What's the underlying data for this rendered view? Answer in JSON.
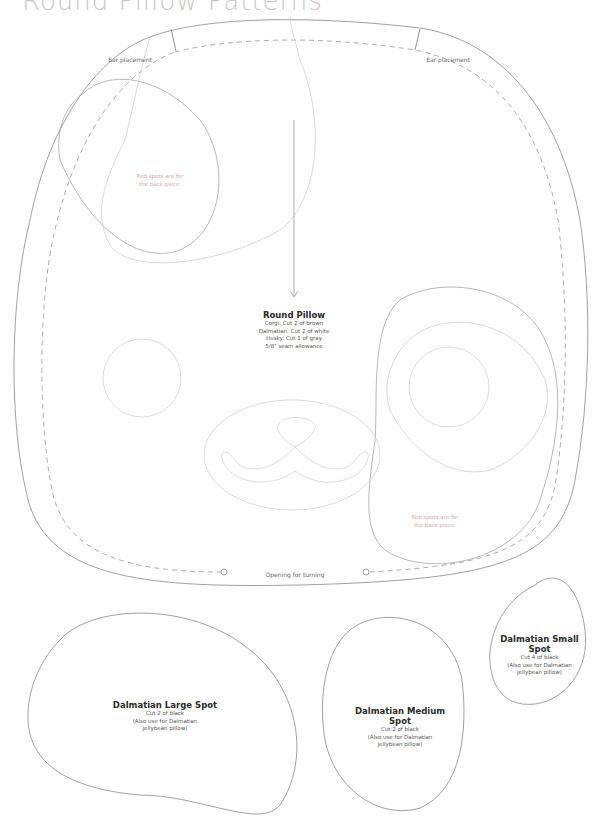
{
  "page": {
    "title": "Round Pillow Patterns"
  },
  "main_piece": {
    "name": "Round Pillow",
    "lines": [
      "Corgi: Cut 2 of brown",
      "Dalmatian: Cut 2 of white",
      "Husky: Cut 1 of gray",
      "5/8\" seam allowance"
    ],
    "ear_left": "Ear placement",
    "ear_right": "Ear placement",
    "opening": "Opening for turning",
    "spot_note_left": [
      "Red spots are for",
      "the back piece."
    ],
    "spot_note_right": [
      "Red spots are for",
      "the back piece."
    ]
  },
  "spots": [
    {
      "name": "Dalmatian Large Spot",
      "lines": [
        "Cut 2 of black",
        "(Also use for Dalmatian",
        "jellybean pillow)"
      ]
    },
    {
      "name_lines": [
        "Dalmatian Medium",
        "Spot"
      ],
      "lines": [
        "Cut 2 of black",
        "(Also use for Dalmatian",
        "jellybean pillow)"
      ]
    },
    {
      "name_lines": [
        "Dalmatian Small",
        "Spot"
      ],
      "lines": [
        "Cut 4 of black",
        "(Also use for Dalmatian",
        "jellybean pillow)"
      ]
    }
  ],
  "colors": {
    "outline": "#777777",
    "light_line": "#c8c8c8",
    "pink_text": "#e0a8a8",
    "title": "#c8c8c8"
  }
}
